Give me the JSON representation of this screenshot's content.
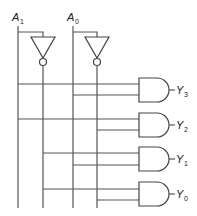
{
  "diagram": {
    "inputs": [
      {
        "name": "A",
        "sub": "1"
      },
      {
        "name": "A",
        "sub": "0"
      }
    ],
    "outputs": [
      {
        "name": "Y",
        "sub": "3"
      },
      {
        "name": "Y",
        "sub": "2"
      },
      {
        "name": "Y",
        "sub": "1"
      },
      {
        "name": "Y",
        "sub": "0"
      }
    ],
    "components": {
      "inverters": 2,
      "and_gates": 4
    },
    "colors": {
      "line": "#555555",
      "background": "#ffffff"
    }
  }
}
